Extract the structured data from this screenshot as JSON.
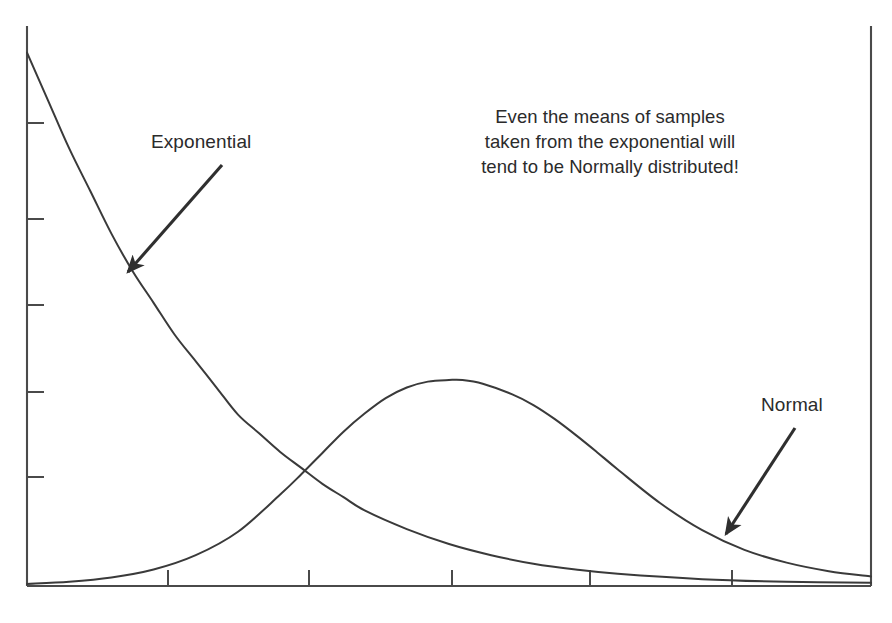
{
  "figure": {
    "background_color": "#ffffff",
    "ink_color": "#3a3a3a",
    "text_color": "#2b2b2b",
    "width": 892,
    "height": 623
  },
  "annotations": {
    "exponential_label": "Exponential",
    "normal_label": "Normal",
    "note": "Even the means of samples\ntaken from the exponential will\ntend to be Normally distributed!"
  },
  "chart_data": {
    "type": "line",
    "title": "",
    "xlabel": "",
    "ylabel": "",
    "grid": false,
    "legend": "none",
    "axis_style": {
      "left_spine": true,
      "right_spine": true,
      "bottom_spine": true,
      "top_spine": false,
      "tick_labels": false,
      "y_tick_count": 5,
      "x_tick_count": 5,
      "y_tick_pixels": [
        123,
        219,
        305,
        392,
        477
      ],
      "x_tick_pixels": [
        168,
        309,
        452,
        590,
        732
      ],
      "plot_left_px": 27,
      "plot_right_px": 871,
      "plot_top_px": 26,
      "plot_baseline_px": 585
    },
    "xlim": [
      0,
      10
    ],
    "ylim": [
      0,
      1.05
    ],
    "series": [
      {
        "name": "Exponential",
        "description": "Decaying exponential density starting high at x=0 and approaching zero",
        "x": [
          0,
          0.25,
          0.5,
          0.75,
          1,
          1.25,
          1.5,
          1.75,
          2,
          2.25,
          2.5,
          2.75,
          3,
          3.25,
          3.5,
          3.75,
          4,
          4.5,
          5,
          5.5,
          6,
          6.5,
          7,
          8,
          9,
          10
        ],
        "y": [
          1.0,
          0.91,
          0.82,
          0.74,
          0.66,
          0.59,
          0.53,
          0.47,
          0.42,
          0.37,
          0.32,
          0.285,
          0.25,
          0.22,
          0.19,
          0.165,
          0.14,
          0.105,
          0.077,
          0.056,
          0.04,
          0.029,
          0.021,
          0.011,
          0.006,
          0.004
        ]
      },
      {
        "name": "Normal",
        "description": "Bell curve peaking near the middle-right of the axis",
        "peak_x": 5.16,
        "peak_y": 0.385,
        "x": [
          0,
          0.5,
          1,
          1.5,
          2,
          2.5,
          3,
          3.25,
          3.5,
          3.75,
          4,
          4.25,
          4.5,
          4.75,
          5,
          5.16,
          5.4,
          5.75,
          6,
          6.25,
          6.5,
          6.75,
          7,
          7.5,
          8,
          8.5,
          9,
          9.5,
          10
        ],
        "y": [
          0.002,
          0.006,
          0.014,
          0.029,
          0.056,
          0.1,
          0.17,
          0.208,
          0.248,
          0.288,
          0.322,
          0.351,
          0.371,
          0.382,
          0.385,
          0.385,
          0.378,
          0.358,
          0.338,
          0.312,
          0.282,
          0.25,
          0.217,
          0.154,
          0.103,
          0.066,
          0.042,
          0.026,
          0.016
        ]
      }
    ],
    "arrows": [
      {
        "name": "exponential-arrow",
        "from_px": [
          222,
          165
        ],
        "to_px": [
          128,
          272
        ],
        "points_to": "Exponential"
      },
      {
        "name": "normal-arrow",
        "from_px": [
          795,
          428
        ],
        "to_px": [
          726,
          534
        ],
        "points_to": "Normal"
      }
    ]
  }
}
